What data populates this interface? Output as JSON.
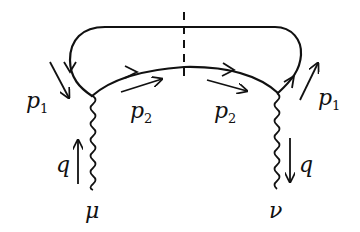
{
  "diagram": {
    "type": "feynman",
    "colors": {
      "ink": "#111111",
      "background": "#ffffff"
    },
    "labels": {
      "p1_left": {
        "base": "p",
        "sub": "1"
      },
      "p2_left": {
        "base": "p",
        "sub": "2"
      },
      "p2_right": {
        "base": "p",
        "sub": "2"
      },
      "p1_right": {
        "base": "p",
        "sub": "1"
      },
      "q_left": "q",
      "q_right": "q",
      "mu": "μ",
      "nu": "ν"
    },
    "elements": [
      {
        "name": "outer-fermion-loop",
        "kind": "solid-line",
        "label": "p1"
      },
      {
        "name": "inner-fermion-arc",
        "kind": "solid-line-with-arrows",
        "label": "p2"
      },
      {
        "name": "cut-line",
        "kind": "dashed-vertical"
      },
      {
        "name": "photon-mu",
        "kind": "wavy-line",
        "index": "μ",
        "momentum": "q",
        "direction": "up"
      },
      {
        "name": "photon-nu",
        "kind": "wavy-line",
        "index": "ν",
        "momentum": "q",
        "direction": "down"
      }
    ]
  }
}
